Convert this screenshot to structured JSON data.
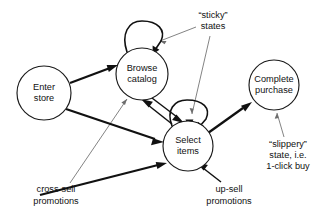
{
  "diagram": {
    "type": "state-diagram",
    "canvas": {
      "width": 327,
      "height": 219,
      "background": "#ffffff"
    },
    "colors": {
      "node_stroke": "#1a1a1a",
      "node_fill": "#ffffff",
      "edge_strong": "#111111",
      "edge_annotation": "#6d6d6d",
      "text": "#111111"
    },
    "nodes": [
      {
        "id": "enter-store",
        "lines": [
          "Enter",
          "store"
        ],
        "line1": "Enter",
        "line2": "store",
        "cx": 44,
        "cy": 93,
        "r": 27
      },
      {
        "id": "browse-catalog",
        "lines": [
          "Browse",
          "catalog"
        ],
        "line1": "Browse",
        "line2": "catalog",
        "cx": 142,
        "cy": 74,
        "r": 26
      },
      {
        "id": "select-items",
        "lines": [
          "Select",
          "items"
        ],
        "line1": "Select",
        "line2": "items",
        "cx": 188,
        "cy": 146,
        "r": 25
      },
      {
        "id": "complete-purchase",
        "lines": [
          "Complete",
          "purchase"
        ],
        "line1": "Complete",
        "line2": "purchase",
        "cx": 274,
        "cy": 85,
        "r": 25
      }
    ],
    "annotations": [
      {
        "id": "sticky-states",
        "lines": [
          "“sticky”",
          "states"
        ],
        "line1": "“sticky”",
        "line2": "states",
        "x": 213,
        "y": 16
      },
      {
        "id": "slippery-state",
        "lines": [
          "“slippery”",
          "state, i.e.",
          "1-click buy"
        ],
        "line1": "“slippery”",
        "line2": "state, i.e.",
        "line3": "1-click buy",
        "x": 288,
        "y": 145
      },
      {
        "id": "cross-sell-promotions",
        "lines": [
          "cross-sell",
          "promotions"
        ],
        "line1": "cross-sell",
        "line2": "promotions",
        "x": 56,
        "y": 190
      },
      {
        "id": "up-sell-promotions",
        "lines": [
          "up-sell",
          "promotions"
        ],
        "line1": "up-sell",
        "line2": "promotions",
        "x": 229,
        "y": 190
      }
    ],
    "edges": [
      {
        "id": "enter-store-to-browse-catalog",
        "from": "enter-store",
        "to": "browse-catalog",
        "weight": "thick"
      },
      {
        "id": "enter-store-to-select-items",
        "from": "enter-store",
        "to": "select-items",
        "weight": "thick"
      },
      {
        "id": "browse-catalog-to-select-items",
        "from": "browse-catalog",
        "to": "select-items",
        "weight": "medium"
      },
      {
        "id": "select-items-to-browse-catalog",
        "from": "select-items",
        "to": "browse-catalog",
        "weight": "medium"
      },
      {
        "id": "select-items-to-complete-purchase",
        "from": "select-items",
        "to": "complete-purchase",
        "weight": "thick"
      },
      {
        "id": "browse-catalog-self-loop",
        "from": "browse-catalog",
        "to": "browse-catalog",
        "weight": "loop"
      },
      {
        "id": "select-items-self-loop",
        "from": "select-items",
        "to": "select-items",
        "weight": "loop"
      },
      {
        "id": "cross-sell-to-select-items",
        "from": "cross-sell-promotions",
        "to": "select-items",
        "weight": "thick"
      },
      {
        "id": "up-sell-to-select-items",
        "from": "up-sell-promotions",
        "to": "select-items",
        "weight": "medium"
      }
    ],
    "annotation_pointers": [
      {
        "id": "sticky-pointer-browse-loop",
        "from": "sticky-states",
        "to": "browse-catalog-self-loop"
      },
      {
        "id": "sticky-pointer-select-loop",
        "from": "sticky-states",
        "to": "select-items-self-loop"
      },
      {
        "id": "slippery-pointer-complete-purchase",
        "from": "slippery-state",
        "to": "complete-purchase"
      },
      {
        "id": "cross-sell-pointer-browse-catalog",
        "from": "cross-sell-promotions",
        "to": "browse-catalog"
      }
    ]
  }
}
